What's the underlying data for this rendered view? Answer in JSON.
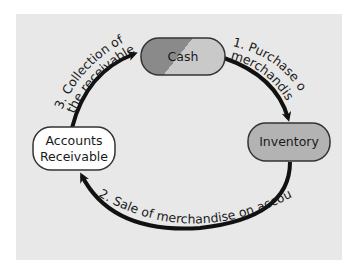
{
  "diagram": {
    "background_color": "#e8e8e8",
    "nodes": [
      {
        "id": "cash",
        "label": "Cash",
        "colors": [
          "#8a8a8a",
          "#c9c9c9"
        ]
      },
      {
        "id": "inventory",
        "label": "Inventory",
        "color": "#b3b3b3"
      },
      {
        "id": "accounts_receivable",
        "label_line1": "Accounts",
        "label_line2": "Receivable",
        "color": "#ffffff"
      }
    ],
    "edges": [
      {
        "from": "cash",
        "to": "inventory",
        "label_line1": "1. Purchase of",
        "label_line2": "merchandise"
      },
      {
        "from": "inventory",
        "to": "accounts_receivable",
        "label": "2. Sale of merchandise on account"
      },
      {
        "from": "accounts_receivable",
        "to": "cash",
        "label_line1": "3. Collection of",
        "label_line2": "the receivables"
      }
    ]
  }
}
